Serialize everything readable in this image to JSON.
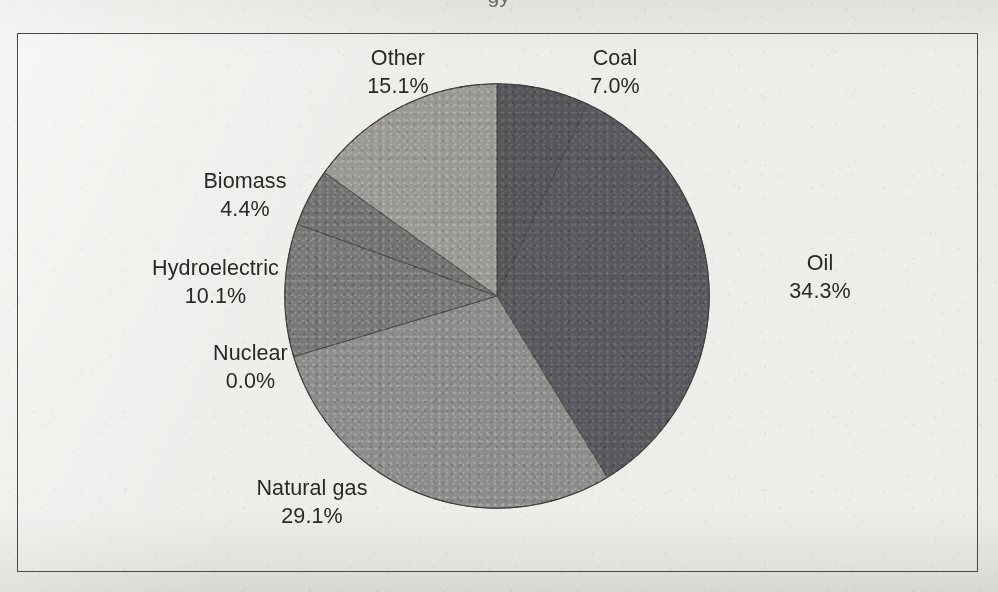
{
  "figure": {
    "title_remnant": "gy",
    "frame_color": "#4b4945",
    "paper_color": "#ecebe7"
  },
  "chart_data": {
    "type": "pie",
    "title": "",
    "xlabel": "",
    "ylabel": "",
    "units": "percent",
    "legend": "none",
    "labels_position": "outside",
    "start_angle_deg": 0,
    "direction": "clockwise",
    "categories": [
      "Coal",
      "Oil",
      "Natural gas",
      "Nuclear",
      "Hydroelectric",
      "Biomass",
      "Other"
    ],
    "values": [
      7.0,
      34.3,
      29.1,
      0.0,
      10.1,
      4.4,
      15.1
    ],
    "value_labels": [
      "7.0%",
      "34.3%",
      "29.1%",
      "0.0%",
      "10.1%",
      "4.4%",
      "15.1%"
    ],
    "colors": [
      "#58565a",
      "#5b595d",
      "#8e8c8a",
      "#7e7c7a",
      "#7a7876",
      "#757371",
      "#9b9996"
    ],
    "total": 100.0,
    "slices": [
      {
        "name": "Coal",
        "value": 7.0,
        "label": "Coal",
        "pct": "7.0%",
        "color": "#58565a",
        "start_deg": 0.0,
        "end_deg": 25.2
      },
      {
        "name": "Oil",
        "value": 34.3,
        "label": "Oil",
        "pct": "34.3%",
        "color": "#5b595d",
        "start_deg": 25.2,
        "end_deg": 148.7
      },
      {
        "name": "Natural gas",
        "value": 29.1,
        "label": "Natural gas",
        "pct": "29.1%",
        "color": "#8e8c8a",
        "start_deg": 148.7,
        "end_deg": 253.4
      },
      {
        "name": "Nuclear",
        "value": 0.0,
        "label": "Nuclear",
        "pct": "0.0%",
        "color": "#7e7c7a",
        "start_deg": 253.4,
        "end_deg": 253.4
      },
      {
        "name": "Hydroelectric",
        "value": 10.1,
        "label": "Hydroelectric",
        "pct": "10.1%",
        "color": "#7a7876",
        "start_deg": 253.4,
        "end_deg": 289.8
      },
      {
        "name": "Biomass",
        "value": 4.4,
        "label": "Biomass",
        "pct": "4.4%",
        "color": "#757371",
        "start_deg": 289.8,
        "end_deg": 305.6
      },
      {
        "name": "Other",
        "value": 15.1,
        "label": "Other",
        "pct": "15.1%",
        "color": "#9b9996",
        "start_deg": 305.6,
        "end_deg": 360.0
      }
    ]
  }
}
